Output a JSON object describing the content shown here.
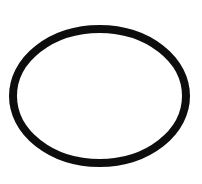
{
  "image": {
    "width": 202,
    "height": 184,
    "background_color": "#ffffff",
    "subject_name": "o-ring-outline",
    "description": "Single closed black elliptical ring outline on a plain white background",
    "visible_text": [],
    "marks_in_interior": "none",
    "border": "none"
  },
  "figure": {
    "type": "ellipse-outline",
    "stroke_color": "#0b0b0b",
    "fill_color": "none",
    "stroke_width": 8,
    "center_x": 99.5,
    "center_y": 96,
    "outer_radius_x": 90.5,
    "outer_radius_y": 71,
    "mid_radius_x": 86.5,
    "mid_radius_y": 67,
    "extent_left_x": 9,
    "extent_right_x": 190,
    "extent_top_y": 25,
    "extent_bottom_y": 167,
    "rotation_deg": 0,
    "edge_quality": "slightly rough, scanned line art"
  }
}
